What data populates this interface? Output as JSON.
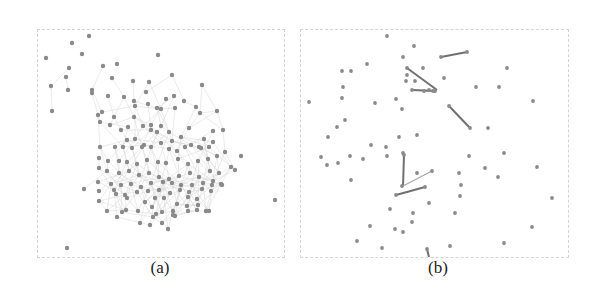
{
  "figure": {
    "panels": [
      {
        "id": "a",
        "caption": "(a)",
        "description": "Dense network: large central cluster of nodes with many faint edges, plus scattered outlier nodes",
        "box": {
          "x": 37,
          "y": 29,
          "w": 246,
          "h": 227
        },
        "node_color": "#8a8a8a",
        "edge_color": "#d6d6d6",
        "nodes": [
          [
            88,
            35
          ],
          [
            71,
            42
          ],
          [
            81,
            53
          ],
          [
            45,
            57
          ],
          [
            68,
            67
          ],
          [
            65,
            76
          ],
          [
            102,
            65
          ],
          [
            116,
            63
          ],
          [
            157,
            54
          ],
          [
            111,
            77
          ],
          [
            132,
            80
          ],
          [
            148,
            81
          ],
          [
            171,
            74
          ],
          [
            201,
            84
          ],
          [
            50,
            85
          ],
          [
            67,
            89
          ],
          [
            91,
            89
          ],
          [
            91,
            92
          ],
          [
            107,
            95
          ],
          [
            123,
            96
          ],
          [
            133,
            100
          ],
          [
            134,
            105
          ],
          [
            145,
            91
          ],
          [
            147,
            103
          ],
          [
            165,
            98
          ],
          [
            173,
            95
          ],
          [
            174,
            107
          ],
          [
            195,
            106
          ],
          [
            216,
            110
          ],
          [
            51,
            110
          ],
          [
            97,
            114
          ],
          [
            101,
            111
          ],
          [
            99,
            121
          ],
          [
            113,
            116
          ],
          [
            133,
            116
          ],
          [
            156,
            107
          ],
          [
            160,
            108
          ],
          [
            183,
            100
          ],
          [
            199,
            112
          ],
          [
            150,
            124
          ],
          [
            160,
            125
          ],
          [
            142,
            125
          ],
          [
            127,
            126
          ],
          [
            120,
            129
          ],
          [
            109,
            124
          ],
          [
            126,
            139
          ],
          [
            134,
            138
          ],
          [
            143,
            144
          ],
          [
            150,
            129
          ],
          [
            156,
            131
          ],
          [
            168,
            131
          ],
          [
            171,
            140
          ],
          [
            180,
            136
          ],
          [
            188,
            127
          ],
          [
            212,
            130
          ],
          [
            203,
            138
          ],
          [
            198,
            146
          ],
          [
            208,
            146
          ],
          [
            222,
            129
          ],
          [
            240,
            155
          ],
          [
            99,
            146
          ],
          [
            114,
            146
          ],
          [
            122,
            146
          ],
          [
            131,
            147
          ],
          [
            141,
            146
          ],
          [
            150,
            146
          ],
          [
            160,
            142
          ],
          [
            168,
            148
          ],
          [
            176,
            150
          ],
          [
            184,
            146
          ],
          [
            190,
            144
          ],
          [
            200,
            147
          ],
          [
            212,
            141
          ],
          [
            224,
            151
          ],
          [
            98,
            157
          ],
          [
            107,
            160
          ],
          [
            118,
            160
          ],
          [
            126,
            161
          ],
          [
            136,
            163
          ],
          [
            146,
            159
          ],
          [
            157,
            161
          ],
          [
            165,
            162
          ],
          [
            177,
            158
          ],
          [
            187,
            163
          ],
          [
            197,
            160
          ],
          [
            207,
            158
          ],
          [
            216,
            155
          ],
          [
            230,
            166
          ],
          [
            234,
            169
          ],
          [
            98,
            167
          ],
          [
            106,
            170
          ],
          [
            118,
            172
          ],
          [
            128,
            170
          ],
          [
            138,
            174
          ],
          [
            148,
            172
          ],
          [
            158,
            176
          ],
          [
            168,
            178
          ],
          [
            178,
            175
          ],
          [
            189,
            172
          ],
          [
            198,
            176
          ],
          [
            209,
            170
          ],
          [
            218,
            172
          ],
          [
            97,
            181
          ],
          [
            110,
            183
          ],
          [
            120,
            184
          ],
          [
            130,
            183
          ],
          [
            140,
            186
          ],
          [
            150,
            182
          ],
          [
            162,
            181
          ],
          [
            171,
            182
          ],
          [
            180,
            184
          ],
          [
            191,
            184
          ],
          [
            202,
            182
          ],
          [
            212,
            180
          ],
          [
            221,
            184
          ],
          [
            83,
            188
          ],
          [
            98,
            190
          ],
          [
            113,
            189
          ],
          [
            124,
            194
          ],
          [
            136,
            191
          ],
          [
            147,
            190
          ],
          [
            158,
            189
          ],
          [
            169,
            192
          ],
          [
            179,
            189
          ],
          [
            188,
            191
          ],
          [
            201,
            188
          ],
          [
            211,
            184
          ],
          [
            220,
            183
          ],
          [
            98,
            200
          ],
          [
            115,
            193
          ],
          [
            126,
            197
          ],
          [
            144,
            201
          ],
          [
            154,
            197
          ],
          [
            163,
            197
          ],
          [
            176,
            203
          ],
          [
            187,
            196
          ],
          [
            196,
            198
          ],
          [
            210,
            190
          ],
          [
            106,
            210
          ],
          [
            121,
            211
          ],
          [
            137,
            210
          ],
          [
            151,
            206
          ],
          [
            161,
            211
          ],
          [
            172,
            210
          ],
          [
            186,
            205
          ],
          [
            196,
            209
          ],
          [
            208,
            210
          ],
          [
            116,
            216
          ],
          [
            125,
            209
          ],
          [
            152,
            216
          ],
          [
            174,
            215
          ],
          [
            187,
            210
          ],
          [
            205,
            210
          ],
          [
            155,
            213
          ],
          [
            161,
            222
          ],
          [
            172,
            214
          ],
          [
            139,
            222
          ],
          [
            149,
            224
          ],
          [
            167,
            228
          ],
          [
            197,
            204
          ],
          [
            274,
            199
          ],
          [
            66,
            247
          ]
        ]
      },
      {
        "id": "b",
        "caption": "(b)",
        "description": "Sparse network: scattered nodes with only a few dark edges",
        "box": {
          "x": 300,
          "y": 29,
          "w": 267,
          "h": 227
        },
        "node_color": "#8a8a8a",
        "edge_color": "#707070",
        "nodes": [
          [
            386,
            35
          ],
          [
            413,
            45
          ],
          [
            402,
            56
          ],
          [
            440,
            56
          ],
          [
            466,
            51
          ],
          [
            506,
            67
          ],
          [
            341,
            70
          ],
          [
            350,
            70
          ],
          [
            366,
            63
          ],
          [
            406,
            67
          ],
          [
            422,
            67
          ],
          [
            405,
            80
          ],
          [
            406,
            74
          ],
          [
            414,
            80
          ],
          [
            443,
            77
          ],
          [
            475,
            86
          ],
          [
            498,
            86
          ],
          [
            423,
            90
          ],
          [
            434,
            90
          ],
          [
            411,
            89
          ],
          [
            428,
            89
          ],
          [
            432,
            90
          ],
          [
            532,
            100
          ],
          [
            342,
            86
          ],
          [
            341,
            97
          ],
          [
            308,
            101
          ],
          [
            374,
            102
          ],
          [
            395,
            98
          ],
          [
            401,
            108
          ],
          [
            448,
            105
          ],
          [
            469,
            127
          ],
          [
            487,
            127
          ],
          [
            336,
            126
          ],
          [
            344,
            119
          ],
          [
            327,
            136
          ],
          [
            398,
            136
          ],
          [
            416,
            134
          ],
          [
            370,
            144
          ],
          [
            385,
            146
          ],
          [
            503,
            152
          ],
          [
            320,
            156
          ],
          [
            326,
            164
          ],
          [
            349,
            155
          ],
          [
            362,
            158
          ],
          [
            386,
            155
          ],
          [
            403,
            154
          ],
          [
            468,
            155
          ],
          [
            536,
            166
          ],
          [
            337,
            162
          ],
          [
            350,
            179
          ],
          [
            402,
            152
          ],
          [
            416,
            172
          ],
          [
            431,
            170
          ],
          [
            458,
            172
          ],
          [
            484,
            167
          ],
          [
            497,
            176
          ],
          [
            460,
            184
          ],
          [
            395,
            194
          ],
          [
            424,
            186
          ],
          [
            401,
            185
          ],
          [
            459,
            195
          ],
          [
            551,
            197
          ],
          [
            389,
            208
          ],
          [
            428,
            202
          ],
          [
            412,
            212
          ],
          [
            454,
            212
          ],
          [
            369,
            225
          ],
          [
            394,
            228
          ],
          [
            402,
            231
          ],
          [
            411,
            221
          ],
          [
            356,
            240
          ],
          [
            381,
            247
          ],
          [
            426,
            248
          ],
          [
            449,
            245
          ],
          [
            503,
            242
          ],
          [
            531,
            226
          ]
        ],
        "edges": [
          [
            [
              440,
              56
            ],
            [
              466,
              51
            ]
          ],
          [
            [
              406,
              67
            ],
            [
              436,
              89
            ]
          ],
          [
            [
              411,
              89
            ],
            [
              434,
              90
            ]
          ],
          [
            [
              448,
              105
            ],
            [
              469,
              127
            ]
          ],
          [
            [
              403,
              154
            ],
            [
              402,
              185
            ]
          ],
          [
            [
              402,
              185
            ],
            [
              431,
              170
            ]
          ],
          [
            [
              395,
              194
            ],
            [
              424,
              186
            ]
          ],
          [
            [
              426,
              248
            ],
            [
              428,
              256
            ]
          ]
        ]
      }
    ]
  }
}
